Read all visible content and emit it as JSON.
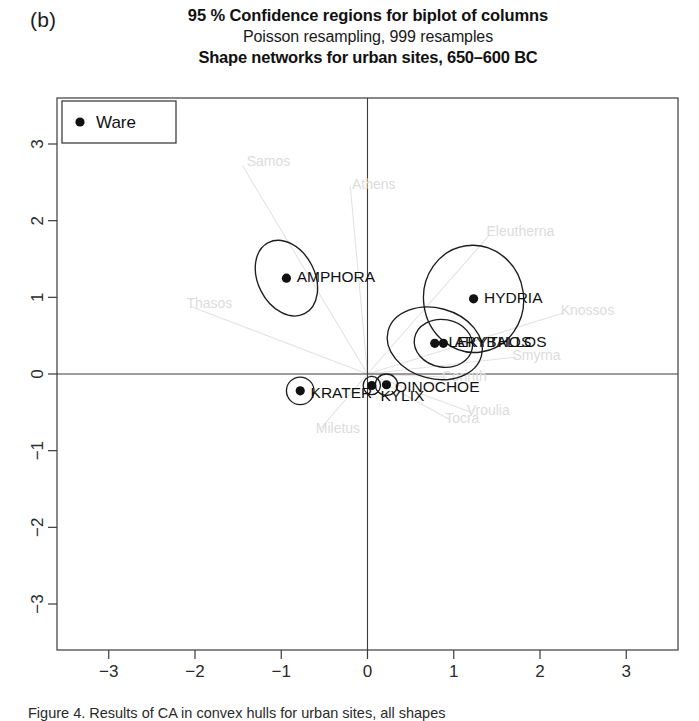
{
  "figure": {
    "panel_letter": "(b)",
    "title_main": "95 % Confidence regions for biplot of columns",
    "title_sub": "Poisson resampling, 999 resamples",
    "title_third": "Shape networks for urban sites, 650–600 BC",
    "caption": "Figure 4. Results of CA in convex hulls for urban sites, all shapes"
  },
  "legend": {
    "label": "Ware",
    "marker": "filled-circle"
  },
  "chart_data": {
    "type": "scatter",
    "title": "95 % Confidence regions for biplot of columns",
    "subtitle": "Poisson resampling, 999 resamples",
    "subtitle2": "Shape networks for urban sites, 650–600 BC",
    "xlabel": "",
    "ylabel": "",
    "xlim": [
      -3.6,
      3.6
    ],
    "ylim": [
      -3.6,
      3.6
    ],
    "xticks": [
      -3,
      -2,
      -1,
      0,
      1,
      2,
      3
    ],
    "yticks": [
      -3,
      -2,
      -1,
      0,
      1,
      2,
      3
    ],
    "xtick_labels": [
      "−3",
      "−2",
      "−1",
      "0",
      "1",
      "2",
      "3"
    ],
    "ytick_labels": [
      "−3",
      "−2",
      "−1",
      "0",
      "1",
      "2",
      "3"
    ],
    "grid": false,
    "legend_position": "top-left",
    "origin_lines": true,
    "series": [
      {
        "name": "Ware",
        "marker": "filled-circle",
        "color": "#111111",
        "points": [
          {
            "label": "AMPHORA",
            "x": -0.94,
            "y": 1.25,
            "ellipse": {
              "rx": 0.33,
              "ry": 0.52,
              "angle": -27
            },
            "label_dx": 0.12,
            "label_dy": 0.02
          },
          {
            "label": "HYDRIA",
            "x": 1.23,
            "y": 0.98,
            "ellipse": {
              "rx": 0.58,
              "ry": 0.7,
              "angle": -8
            },
            "label_dx": 0.12,
            "label_dy": 0.02
          },
          {
            "label": "ARYBALLOS",
            "x": 0.88,
            "y": 0.4,
            "ellipse": {
              "rx": 0.34,
              "ry": 0.31,
              "angle": 10
            },
            "label_dx": 0.13,
            "label_dy": 0.02
          },
          {
            "label": "LEKYTHOS",
            "x": 0.78,
            "y": 0.4,
            "ellipse": {
              "rx": 0.56,
              "ry": 0.46,
              "angle": 15
            },
            "label_dx": 0.16,
            "label_dy": 0.02
          },
          {
            "label": "OINOCHOE",
            "x": 0.22,
            "y": -0.14,
            "ellipse": {
              "rx": 0.13,
              "ry": 0.14,
              "angle": 0
            },
            "label_dx": 0.1,
            "label_dy": -0.03
          },
          {
            "label": "KYLIX",
            "x": 0.05,
            "y": -0.15,
            "ellipse": {
              "rx": 0.1,
              "ry": 0.12,
              "angle": 0
            },
            "label_dx": 0.1,
            "label_dy": -0.13
          },
          {
            "label": "KRATER",
            "x": -0.78,
            "y": -0.22,
            "ellipse": {
              "rx": 0.16,
              "ry": 0.18,
              "angle": 0
            },
            "label_dx": 0.12,
            "label_dy": -0.02
          }
        ]
      }
    ],
    "site_vectors": [
      {
        "label": "Samos",
        "x": -1.45,
        "y": 2.72,
        "label_x": -1.4,
        "label_y": 2.78
      },
      {
        "label": "Athens",
        "x": -0.2,
        "y": 2.45,
        "label_x": -0.18,
        "label_y": 2.48
      },
      {
        "label": "Eleutherna",
        "x": 1.42,
        "y": 1.82,
        "label_x": 1.38,
        "label_y": 1.86
      },
      {
        "label": "Knossos",
        "x": 2.28,
        "y": 0.8,
        "label_x": 2.24,
        "label_y": 0.84
      },
      {
        "label": "Smyrna",
        "x": 1.72,
        "y": 0.22,
        "label_x": 1.68,
        "label_y": 0.25
      },
      {
        "label": "Corinth",
        "x": 0.92,
        "y": -0.04,
        "label_x": 0.86,
        "label_y": -0.03
      },
      {
        "label": "Vroulia",
        "x": 1.2,
        "y": -0.5,
        "label_x": 1.15,
        "label_y": -0.47
      },
      {
        "label": "Tocra",
        "x": 0.96,
        "y": -0.6,
        "label_x": 0.9,
        "label_y": -0.57
      },
      {
        "label": "Miletus",
        "x": -0.55,
        "y": -0.72,
        "label_x": -0.6,
        "label_y": -0.7
      },
      {
        "label": "Thasos",
        "x": -2.05,
        "y": 0.88,
        "label_x": -2.1,
        "label_y": 0.92
      }
    ]
  }
}
